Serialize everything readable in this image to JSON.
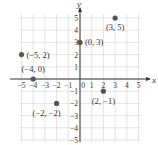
{
  "chart_data": {
    "type": "scatter",
    "title": "",
    "xlabel": "x",
    "ylabel": "y",
    "xlim": [
      -5,
      5
    ],
    "ylim": [
      -5,
      5
    ],
    "grid": true,
    "x_ticks": [
      -5,
      -4,
      -3,
      -2,
      -1,
      0,
      1,
      2,
      3,
      4,
      5
    ],
    "y_ticks": [
      -5,
      -4,
      -3,
      -2,
      -1,
      1,
      2,
      3,
      4,
      5
    ],
    "x_tick_labels": [
      "−5",
      "−4",
      "−3",
      "−2",
      "−1",
      "0",
      "1",
      "2",
      "3",
      "4",
      "5"
    ],
    "y_tick_labels": [
      "−5",
      "−4",
      "−3",
      "−2",
      "−1",
      "1",
      "2",
      "3",
      "4",
      "5"
    ],
    "points": [
      {
        "x": 3,
        "y": 5,
        "label": "(3, 5)"
      },
      {
        "x": 0,
        "y": 3,
        "label": "(0, 3)"
      },
      {
        "x": -5,
        "y": 2,
        "label": "(−5, 2)"
      },
      {
        "x": -4,
        "y": 0,
        "label": "(−4, 0)"
      },
      {
        "x": 2,
        "y": -1,
        "label": "(2, −1)"
      },
      {
        "x": -2,
        "y": -2,
        "label": "(−2, −2)"
      }
    ],
    "colors": {
      "point": "#555555",
      "axis": "#333333",
      "grid": "#d8d8d8"
    }
  }
}
